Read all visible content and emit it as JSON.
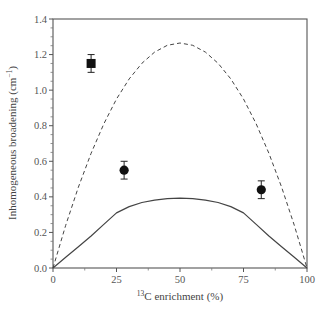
{
  "chart_data": {
    "type": "line",
    "title": "",
    "xlabel": "13C enrichment (%)",
    "xlabel_sup": "13",
    "xlabel_rest": "C enrichment (%)",
    "ylabel": "Inhomogeneous broadening (cm-1)",
    "ylabel_main": "Inhomogeneous broadening (cm",
    "ylabel_sup": "−1",
    "ylabel_close": ")",
    "xlim": [
      0,
      100
    ],
    "ylim": [
      0.0,
      1.4
    ],
    "xticks": [
      "0",
      "25",
      "50",
      "75",
      "100"
    ],
    "yticks": [
      "0.0",
      "0.2",
      "0.4",
      "0.6",
      "0.8",
      "1.0",
      "1.2",
      "1.4"
    ],
    "grid": false,
    "legend": "none",
    "series": [
      {
        "name": "dashed-curve",
        "style": "dashed",
        "x": [
          0,
          5,
          10,
          15,
          20,
          25,
          30,
          35,
          40,
          45,
          50,
          55,
          60,
          65,
          70,
          75,
          80,
          85,
          90,
          95,
          100
        ],
        "y": [
          0.0,
          0.24,
          0.455,
          0.645,
          0.81,
          0.95,
          1.063,
          1.151,
          1.214,
          1.252,
          1.265,
          1.252,
          1.214,
          1.151,
          1.063,
          0.95,
          0.81,
          0.645,
          0.455,
          0.24,
          0.0
        ]
      },
      {
        "name": "solid-curve",
        "style": "solid",
        "x": [
          0,
          5,
          10,
          15,
          20,
          25,
          30,
          35,
          40,
          45,
          50,
          55,
          60,
          65,
          70,
          75,
          80,
          85,
          90,
          95,
          100
        ],
        "y": [
          0.0,
          0.06,
          0.12,
          0.18,
          0.245,
          0.31,
          0.345,
          0.368,
          0.382,
          0.39,
          0.393,
          0.39,
          0.382,
          0.368,
          0.345,
          0.31,
          0.245,
          0.18,
          0.12,
          0.06,
          0.0
        ]
      },
      {
        "name": "square-point",
        "style": "marker-square",
        "x": [
          15
        ],
        "y": [
          1.15
        ],
        "err": [
          0.05
        ]
      },
      {
        "name": "circle-points",
        "style": "marker-circle",
        "x": [
          28,
          82
        ],
        "y": [
          0.55,
          0.44
        ],
        "err": [
          0.05,
          0.05
        ]
      }
    ]
  }
}
